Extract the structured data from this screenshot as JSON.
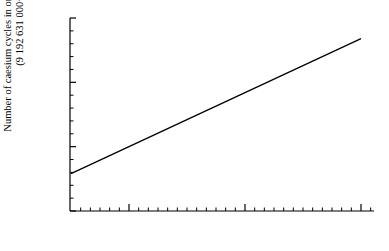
{
  "chart_data": {
    "type": "scatter",
    "title": "",
    "xlabel": "",
    "ylabel": "Number of caesium cycles in one second of UT2",
    "ylabel_line1": "Number of caesium cycles in one second of UT2",
    "ylabel_line2": "(9 192 631 000+)",
    "grid": false,
    "legend": "none",
    "ylim": [
      800,
      950
    ],
    "yticks": [
      800,
      850,
      900,
      950
    ],
    "ytick_labels": [
      "800",
      "850",
      "900",
      "950"
    ],
    "ytick_minor_step": 10,
    "xlim": [
      "1955-05",
      "1958-03"
    ],
    "xticks": [
      "Jan 1956",
      "Jan 1957",
      "Jan 1958"
    ],
    "xtick_labels": [
      "Jan 1956",
      "Jan 1957",
      "Jan 1958"
    ],
    "xtick_minor": "monthly",
    "marker": "filled-circle",
    "marker_color": "#000000",
    "points": [
      {
        "x": "1955-06",
        "y": 871
      },
      {
        "x": "1955-08",
        "y": 843
      },
      {
        "x": "1955-09",
        "y": 831
      },
      {
        "x": "1955-10",
        "y": 822
      },
      {
        "x": "1955-11",
        "y": 838
      },
      {
        "x": "1955-12",
        "y": 839
      },
      {
        "x": "1956-01",
        "y": 845
      },
      {
        "x": "1956-02",
        "y": 824
      },
      {
        "x": "1956-03",
        "y": 840
      },
      {
        "x": "1956-04",
        "y": 848
      },
      {
        "x": "1956-05",
        "y": 855
      },
      {
        "x": "1956-06",
        "y": 842
      },
      {
        "x": "1956-07",
        "y": 862
      },
      {
        "x": "1956-08",
        "y": 865
      },
      {
        "x": "1956-09",
        "y": 866
      },
      {
        "x": "1956-10",
        "y": 891
      },
      {
        "x": "1956-11",
        "y": 866
      },
      {
        "x": "1956-12",
        "y": 877
      },
      {
        "x": "1957-01",
        "y": 883
      },
      {
        "x": "1957-02",
        "y": 894
      },
      {
        "x": "1957-03",
        "y": 871
      },
      {
        "x": "1957-04",
        "y": 872
      },
      {
        "x": "1957-05",
        "y": 899
      },
      {
        "x": "1957-06",
        "y": 897
      },
      {
        "x": "1957-07",
        "y": 913
      },
      {
        "x": "1957-08",
        "y": 903
      },
      {
        "x": "1957-09",
        "y": 915
      },
      {
        "x": "1957-10",
        "y": 921
      },
      {
        "x": "1957-11",
        "y": 908
      },
      {
        "x": "1957-12",
        "y": 925
      },
      {
        "x": "1958-01",
        "y": 933
      },
      {
        "x": "1958-02",
        "y": 934
      }
    ],
    "trend_line": {
      "x_start": "1955-07",
      "y_start": 829,
      "x_end": "1958-01",
      "y_end": 934
    }
  }
}
